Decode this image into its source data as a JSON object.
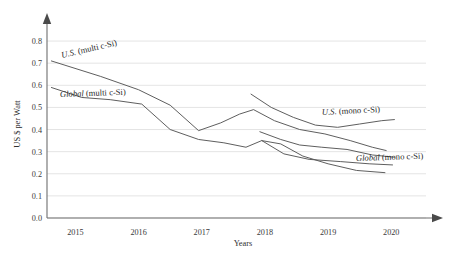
{
  "chart_data": {
    "type": "line",
    "title": "",
    "xlabel": "Years",
    "ylabel": "US $ per Watt",
    "xlim": [
      2014.55,
      2020.55
    ],
    "ylim": [
      0.0,
      0.85
    ],
    "grid": true,
    "legend_position": "inline-annotations",
    "xticks": [
      "2015",
      "2016",
      "2017",
      "2018",
      "2019",
      "2020"
    ],
    "xtick_values": [
      2015,
      2016,
      2017,
      2018,
      2019,
      2020
    ],
    "yticks": [
      "0.0",
      "0.1",
      "0.2",
      "0.3",
      "0.4",
      "0.5",
      "0.6",
      "0.7",
      "0.8"
    ],
    "ytick_values": [
      0.0,
      0.1,
      0.2,
      0.3,
      0.4,
      0.5,
      0.6,
      0.7,
      0.8
    ],
    "series": [
      {
        "name": "U.S. (multi c-Si)",
        "label_style": "italic-prefix",
        "label_prefix": "U.S.",
        "label_suffix": " (multi c-Si)",
        "x": [
          2014.62,
          2015.4,
          2016.0,
          2016.5,
          2016.95,
          2017.3,
          2017.6,
          2017.82,
          2018.15,
          2018.55,
          2018.95,
          2019.35,
          2019.7,
          2019.92
        ],
        "values": [
          0.71,
          0.64,
          0.58,
          0.51,
          0.395,
          0.43,
          0.47,
          0.49,
          0.44,
          0.4,
          0.38,
          0.35,
          0.32,
          0.305
        ]
      },
      {
        "name": "Global (multi c-Si)",
        "label_prefix": "Global",
        "label_suffix": " (multi c-Si)",
        "x": [
          2014.62,
          2015.1,
          2015.55,
          2016.05,
          2016.5,
          2016.95,
          2017.35,
          2017.7,
          2017.95,
          2018.25,
          2018.6,
          2019.0,
          2019.45,
          2019.9
        ],
        "values": [
          0.59,
          0.545,
          0.535,
          0.515,
          0.4,
          0.355,
          0.34,
          0.32,
          0.35,
          0.335,
          0.28,
          0.245,
          0.215,
          0.205
        ]
      },
      {
        "name": "U.S. (mono c-Si)",
        "label_prefix": "U.S.",
        "label_suffix": " (mono c-Si)",
        "x": [
          2017.78,
          2018.1,
          2018.45,
          2018.8,
          2019.15,
          2019.5,
          2019.85,
          2020.05
        ],
        "values": [
          0.56,
          0.5,
          0.455,
          0.42,
          0.41,
          0.425,
          0.44,
          0.445
        ]
      },
      {
        "name": "Global (mono c-Si)",
        "label_prefix": "Global",
        "label_suffix": " (mono c-Si)",
        "x": [
          2017.92,
          2018.25,
          2018.55,
          2018.9,
          2019.3,
          2019.7,
          2020.05
        ],
        "values": [
          0.39,
          0.355,
          0.33,
          0.32,
          0.31,
          0.285,
          0.275
        ]
      },
      {
        "name": "Global (mono c-Si) lower",
        "x": [
          2017.95,
          2018.3,
          2018.7,
          2019.2,
          2019.65,
          2020.02
        ],
        "values": [
          0.35,
          0.29,
          0.265,
          0.255,
          0.245,
          0.24
        ]
      }
    ],
    "annotations": [
      {
        "key": "us_multi",
        "prefix": "U.S.",
        "suffix": " (multi c-Si)",
        "x": 62,
        "y": 58,
        "rotate": -13
      },
      {
        "key": "global_multi",
        "prefix": "Global",
        "suffix": " (multi c-Si)",
        "x": 60,
        "y": 97,
        "rotate": -2
      },
      {
        "key": "us_mono",
        "prefix": "U.S.",
        "suffix": " (mono c-Si)",
        "x": 322,
        "y": 115,
        "rotate": -3
      },
      {
        "key": "global_mono",
        "prefix": "Global",
        "suffix": " (mono c-Si)",
        "x": 356,
        "y": 161,
        "rotate": -2
      }
    ],
    "colors": {
      "line": "#555555",
      "grid": "#d9d9d9",
      "axis": "#6e6e6e",
      "text": "#2e2e2e",
      "background": "#ffffff"
    }
  }
}
